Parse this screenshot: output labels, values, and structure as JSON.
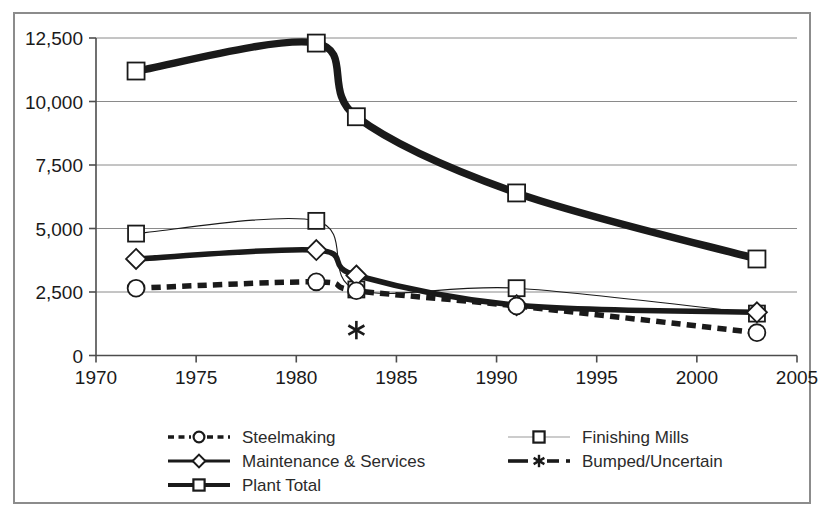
{
  "chart_data": {
    "type": "line",
    "title": "",
    "subtitle": "",
    "xlabel": "",
    "ylabel": "",
    "xlim": [
      1970,
      2005
    ],
    "ylim": [
      0,
      12500
    ],
    "xticks": [
      "1970",
      "1975",
      "1980",
      "1985",
      "1990",
      "1995",
      "2000",
      "2005"
    ],
    "xtick_values": [
      1970,
      1975,
      1980,
      1985,
      1990,
      1995,
      2000,
      2005
    ],
    "yticks": [
      "0",
      "2,500",
      "5,000",
      "7,500",
      "10,000",
      "12,500"
    ],
    "ytick_values": [
      0,
      2500,
      5000,
      7500,
      10000,
      12500
    ],
    "grid": "horizontal",
    "legend_position": "bottom",
    "x": [
      1972,
      1981,
      1983,
      1991,
      2003
    ],
    "series": [
      {
        "name": "Steelmaking",
        "marker": "circle",
        "line": "dashed",
        "thickness": "thick",
        "x": [
          1972,
          1981,
          1983,
          1991,
          2003
        ],
        "values": [
          2650,
          2900,
          2550,
          1950,
          900
        ]
      },
      {
        "name": "Maintenance & Services",
        "marker": "diamond",
        "line": "solid",
        "thickness": "thick",
        "x": [
          1972,
          1981,
          1983,
          1991,
          2003
        ],
        "values": [
          3800,
          4150,
          3150,
          1980,
          1700
        ]
      },
      {
        "name": "Plant Total",
        "marker": "square",
        "line": "solid",
        "thickness": "very-thick",
        "x": [
          1972,
          1981,
          1983,
          1991,
          2003
        ],
        "values": [
          11200,
          12300,
          9400,
          6400,
          3800
        ]
      },
      {
        "name": "Finishing Mills",
        "marker": "square",
        "line": "solid",
        "thickness": "thin",
        "x": [
          1972,
          1981,
          1983,
          1991,
          2003
        ],
        "values": [
          4800,
          5300,
          2600,
          2650,
          1650
        ]
      },
      {
        "name": "Bumped/Uncertain",
        "marker": "asterisk",
        "line": "dash-dot",
        "thickness": "thick",
        "x": [
          1983
        ],
        "values": [
          1000
        ]
      }
    ]
  },
  "legend": {
    "items": [
      {
        "label": "Steelmaking",
        "style": "dashed-circle"
      },
      {
        "label": "Finishing Mills",
        "style": "thin-square"
      },
      {
        "label": "Maintenance & Services",
        "style": "solid-diamond"
      },
      {
        "label": "Bumped/Uncertain",
        "style": "dashdot-asterisk"
      },
      {
        "label": "Plant Total",
        "style": "thick-square"
      }
    ]
  },
  "colors": {
    "ink": "#1a1a1a",
    "grid": "#8a8a8a",
    "frame": "#8c8c8c",
    "background": "#ffffff"
  }
}
